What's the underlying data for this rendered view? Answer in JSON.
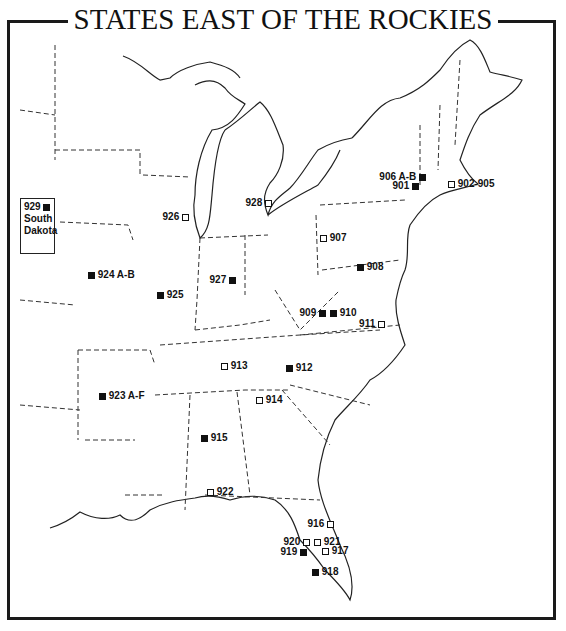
{
  "title": "STATES EAST OF THE ROCKIES",
  "legend": {
    "filled_square": "filled marker",
    "open_square": "open marker"
  },
  "colors": {
    "ink": "#111111",
    "background": "#ffffff",
    "frame": "#1a1a1a"
  },
  "inset": {
    "number": "929",
    "line1": "South",
    "line2": "Dakota",
    "marker": "filled"
  },
  "markers": [
    {
      "id": "m901",
      "label": "901",
      "type": "filled",
      "x": 411,
      "y": 182,
      "label_side": "left"
    },
    {
      "id": "m902-905",
      "label": "902-905",
      "type": "open",
      "x": 448,
      "y": 180,
      "label_side": "right"
    },
    {
      "id": "m906",
      "label": "906 A-B",
      "type": "filled",
      "x": 418,
      "y": 173,
      "label_side": "left"
    },
    {
      "id": "m907",
      "label": "907",
      "type": "open",
      "x": 320,
      "y": 234,
      "label_side": "right"
    },
    {
      "id": "m908",
      "label": "908",
      "type": "filled",
      "x": 357,
      "y": 263,
      "label_side": "right"
    },
    {
      "id": "m909",
      "label": "909",
      "type": "filled",
      "x": 318,
      "y": 309,
      "label_side": "left"
    },
    {
      "id": "m910",
      "label": "910",
      "type": "filled",
      "x": 330,
      "y": 309,
      "label_side": "right"
    },
    {
      "id": "m911",
      "label": "911",
      "type": "open",
      "x": 377,
      "y": 320,
      "label_side": "left"
    },
    {
      "id": "m912",
      "label": "912",
      "type": "filled",
      "x": 286,
      "y": 364,
      "label_side": "right"
    },
    {
      "id": "m913",
      "label": "913",
      "type": "open",
      "x": 221,
      "y": 362,
      "label_side": "right"
    },
    {
      "id": "m914",
      "label": "914",
      "type": "open",
      "x": 256,
      "y": 396,
      "label_side": "right"
    },
    {
      "id": "m915",
      "label": "915",
      "type": "filled",
      "x": 201,
      "y": 434,
      "label_side": "right"
    },
    {
      "id": "m916",
      "label": "916",
      "type": "open",
      "x": 326,
      "y": 520,
      "label_side": "left"
    },
    {
      "id": "m917",
      "label": "917",
      "type": "open",
      "x": 322,
      "y": 547,
      "label_side": "right"
    },
    {
      "id": "m918",
      "label": "918",
      "type": "filled",
      "x": 312,
      "y": 568,
      "label_side": "right"
    },
    {
      "id": "m919",
      "label": "919",
      "type": "filled",
      "x": 299,
      "y": 548,
      "label_side": "left"
    },
    {
      "id": "m920",
      "label": "920",
      "type": "open",
      "x": 302,
      "y": 538,
      "label_side": "left"
    },
    {
      "id": "m921",
      "label": "921",
      "type": "open",
      "x": 314,
      "y": 538,
      "label_side": "right"
    },
    {
      "id": "m922",
      "label": "922",
      "type": "open",
      "x": 207,
      "y": 488,
      "label_side": "right"
    },
    {
      "id": "m923",
      "label": "923 A-F",
      "type": "filled",
      "x": 99,
      "y": 392,
      "label_side": "right"
    },
    {
      "id": "m924",
      "label": "924 A-B",
      "type": "filled",
      "x": 88,
      "y": 271,
      "label_side": "right"
    },
    {
      "id": "m925",
      "label": "925",
      "type": "filled",
      "x": 157,
      "y": 291,
      "label_side": "right"
    },
    {
      "id": "m926",
      "label": "926",
      "type": "open",
      "x": 181,
      "y": 213,
      "label_side": "left"
    },
    {
      "id": "m927",
      "label": "927",
      "type": "filled",
      "x": 228,
      "y": 276,
      "label_side": "left"
    },
    {
      "id": "m928",
      "label": "928",
      "type": "open",
      "x": 264,
      "y": 199,
      "label_side": "left"
    }
  ]
}
